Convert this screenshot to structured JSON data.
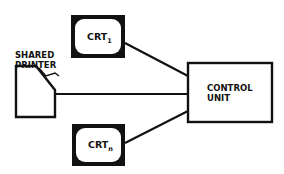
{
  "diagram": {
    "nodes": {
      "crt1": {
        "label": "CRT",
        "subscript": "1"
      },
      "crtn": {
        "label": "CRT",
        "subscript": "n"
      },
      "printer": {
        "line1": "SHARED",
        "line2": "PRINTER"
      },
      "control_unit": {
        "line1": "CONTROL",
        "line2": "UNIT"
      }
    },
    "edges": [
      {
        "from": "crt1",
        "to": "control_unit"
      },
      {
        "from": "printer",
        "to": "control_unit"
      },
      {
        "from": "crtn",
        "to": "control_unit"
      }
    ],
    "colors": {
      "stroke": "#111111",
      "background": "#ffffff"
    }
  }
}
